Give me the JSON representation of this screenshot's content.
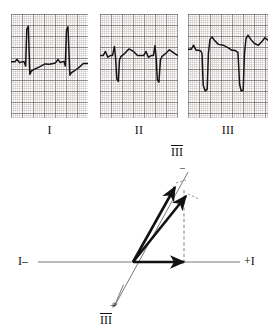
{
  "figure": {
    "kind": "ecg-axis-determination",
    "background_color": "#ffffff",
    "ink_color": "#1a1a1a",
    "grid_color": "#b9b2ae",
    "grid_bold_color": "#6f6a67",
    "trace_color": "#151515",
    "axis_line_color": "#6a6a6a",
    "vector_color": "#111111",
    "dashed_color": "#8c8c8c"
  },
  "strips": [
    {
      "id": "lead-1",
      "label": "I",
      "x": 11,
      "y": 14,
      "w": 77,
      "h": 104,
      "baseline_frac": 0.46,
      "qrs_polarity": "positive",
      "description": "Tall upright R waves, net positive QRS",
      "beats": [
        {
          "points": [
            [
              0.0,
              0.0
            ],
            [
              0.05,
              0.0
            ],
            [
              0.08,
              -0.06
            ],
            [
              0.11,
              0.02
            ],
            [
              0.14,
              0.0
            ],
            [
              0.17,
              0.0
            ],
            [
              0.19,
              0.1
            ],
            [
              0.205,
              -0.78
            ],
            [
              0.225,
              -0.86
            ],
            [
              0.245,
              0.3
            ],
            [
              0.265,
              0.22
            ],
            [
              0.3,
              0.18
            ],
            [
              0.37,
              0.12
            ],
            [
              0.44,
              0.05
            ],
            [
              0.5,
              0.06
            ],
            [
              0.55,
              0.04
            ]
          ]
        },
        {
          "points": [
            [
              0.55,
              0.04
            ],
            [
              0.58,
              0.02
            ],
            [
              0.61,
              -0.06
            ],
            [
              0.64,
              0.02
            ],
            [
              0.665,
              0.0
            ],
            [
              0.69,
              0.0
            ],
            [
              0.705,
              0.1
            ],
            [
              0.72,
              -0.76
            ],
            [
              0.74,
              -0.84
            ],
            [
              0.765,
              0.32
            ],
            [
              0.785,
              0.26
            ],
            [
              0.82,
              0.22
            ],
            [
              0.88,
              0.14
            ],
            [
              0.94,
              0.04
            ],
            [
              1.0,
              0.04
            ]
          ]
        }
      ]
    },
    {
      "id": "lead-2",
      "label": "II",
      "x": 100,
      "y": 14,
      "w": 78,
      "h": 104,
      "baseline_frac": 0.4,
      "qrs_polarity": "negative",
      "description": "Small r wave with deep S wave, net negative QRS",
      "beats": [
        {
          "points": [
            [
              0.0,
              0.0
            ],
            [
              0.04,
              0.0
            ],
            [
              0.07,
              -0.1
            ],
            [
              0.1,
              0.04
            ],
            [
              0.13,
              0.0
            ],
            [
              0.16,
              0.0
            ],
            [
              0.185,
              -0.22
            ],
            [
              0.2,
              0.06
            ],
            [
              0.215,
              0.56
            ],
            [
              0.235,
              0.62
            ],
            [
              0.25,
              0.1
            ],
            [
              0.27,
              0.02
            ],
            [
              0.31,
              -0.04
            ],
            [
              0.37,
              -0.16
            ],
            [
              0.43,
              -0.1
            ],
            [
              0.48,
              0.0
            ],
            [
              0.53,
              0.0
            ]
          ]
        },
        {
          "points": [
            [
              0.53,
              0.0
            ],
            [
              0.56,
              0.0
            ],
            [
              0.59,
              -0.1
            ],
            [
              0.62,
              0.04
            ],
            [
              0.655,
              0.0
            ],
            [
              0.685,
              0.0
            ],
            [
              0.705,
              -0.24
            ],
            [
              0.72,
              0.06
            ],
            [
              0.735,
              0.58
            ],
            [
              0.755,
              0.64
            ],
            [
              0.775,
              0.1
            ],
            [
              0.795,
              0.02
            ],
            [
              0.835,
              -0.04
            ],
            [
              0.89,
              -0.14
            ],
            [
              0.95,
              -0.06
            ],
            [
              1.0,
              0.0
            ]
          ]
        }
      ]
    },
    {
      "id": "lead-3",
      "label": "III",
      "x": 188,
      "y": 14,
      "w": 80,
      "h": 104,
      "baseline_frac": 0.34,
      "qrs_polarity": "strongly-negative",
      "description": "Very deep S waves, markedly negative QRS (left axis deviation)",
      "beats": [
        {
          "points": [
            [
              0.0,
              0.0
            ],
            [
              0.04,
              0.0
            ],
            [
              0.07,
              -0.1
            ],
            [
              0.1,
              0.02
            ],
            [
              0.13,
              0.02
            ],
            [
              0.16,
              0.04
            ],
            [
              0.175,
              0.1
            ],
            [
              0.19,
              0.86
            ],
            [
              0.215,
              1.0
            ],
            [
              0.24,
              0.96
            ],
            [
              0.255,
              0.1
            ],
            [
              0.275,
              -0.24
            ],
            [
              0.3,
              -0.3
            ],
            [
              0.33,
              -0.22
            ],
            [
              0.38,
              -0.12
            ],
            [
              0.44,
              -0.1
            ],
            [
              0.5,
              -0.04
            ],
            [
              0.545,
              0.02
            ]
          ]
        },
        {
          "points": [
            [
              0.545,
              0.02
            ],
            [
              0.575,
              0.02
            ],
            [
              0.6,
              0.04
            ],
            [
              0.625,
              0.08
            ],
            [
              0.645,
              0.84
            ],
            [
              0.665,
              1.0
            ],
            [
              0.69,
              0.98
            ],
            [
              0.705,
              0.12
            ],
            [
              0.725,
              -0.26
            ],
            [
              0.75,
              -0.34
            ],
            [
              0.785,
              -0.24
            ],
            [
              0.83,
              -0.14
            ],
            [
              0.88,
              -0.1
            ],
            [
              0.93,
              -0.2
            ],
            [
              0.96,
              -0.28
            ],
            [
              1.0,
              -0.22
            ]
          ]
        }
      ]
    }
  ],
  "vector_diagram": {
    "origin": {
      "x": 133,
      "y": 262
    },
    "lead1_axis": {
      "label_left": "I–",
      "label_right": "+I",
      "left_end": {
        "x": 38,
        "y": 262
      },
      "right_end": {
        "x": 240,
        "y": 262
      },
      "label_left_pos": {
        "x": 18,
        "y": 254
      },
      "label_right_pos": {
        "x": 244,
        "y": 254
      }
    },
    "lead3_axis": {
      "label_negative": "III",
      "label_negative_sign": "–",
      "label_positive": "III",
      "label_positive_sign": "+",
      "negative_end": {
        "x": 188,
        "y": 172
      },
      "positive_end": {
        "x": 114,
        "y": 307
      },
      "label_negative_pos": {
        "x": 171,
        "y": 145
      },
      "label_negative_sign_pos": {
        "x": 180,
        "y": 162
      },
      "label_positive_pos": {
        "x": 100,
        "y": 313
      },
      "label_positive_sign_pos": {
        "x": 110,
        "y": 300
      }
    },
    "lead1_vector": {
      "name": "lead-1-component-vector",
      "from": {
        "x": 133,
        "y": 262
      },
      "to": {
        "x": 184,
        "y": 262
      },
      "magnitude_note": "net positive deflection in lead I, plotted rightward"
    },
    "lead3_vector": {
      "name": "lead-3-component-vector",
      "from": {
        "x": 133,
        "y": 262
      },
      "to": {
        "x": 175,
        "y": 187
      },
      "magnitude_note": "net negative deflection in lead III, plotted toward the III negative pole"
    },
    "resultant_vector": {
      "name": "mean-qrs-resultant-vector",
      "from": {
        "x": 133,
        "y": 262
      },
      "to": {
        "x": 186,
        "y": 196
      },
      "magnitude_note": "resultant mean QRS axis, leftward/superior"
    },
    "projection_line": {
      "name": "perpendicular-projection",
      "from": {
        "x": 184,
        "y": 190
      },
      "to": {
        "x": 184,
        "y": 262
      },
      "style": "dashed"
    },
    "tick_marks": [
      {
        "from": {
          "x": 176,
          "y": 183
        },
        "to": {
          "x": 186,
          "y": 180
        }
      },
      {
        "from": {
          "x": 188,
          "y": 194
        },
        "to": {
          "x": 199,
          "y": 199
        }
      }
    ]
  }
}
